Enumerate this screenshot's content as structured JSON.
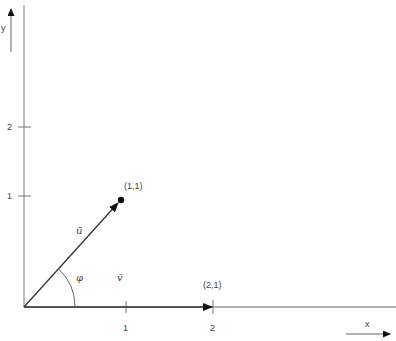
{
  "diagram": {
    "axes": {
      "x_label": "x",
      "y_label": "y",
      "x_ticks": [
        {
          "value": 1,
          "label": "1"
        },
        {
          "value": 2,
          "label": "2"
        }
      ],
      "y_ticks": [
        {
          "value": 1,
          "label": "1"
        },
        {
          "value": 2,
          "label": "2"
        }
      ]
    },
    "vectors": [
      {
        "name": "u",
        "label": "ū",
        "from": [
          0,
          0
        ],
        "to": [
          1,
          1
        ],
        "point_label": "(1,1)"
      },
      {
        "name": "v",
        "label": "̅v",
        "from": [
          0,
          0
        ],
        "to": [
          2,
          0
        ],
        "point_label": "(2,1)"
      }
    ],
    "angle": {
      "label": "φ"
    },
    "labels": {
      "u_vec": "ū",
      "v_vec": "v̄",
      "phi": "φ",
      "pt_u": "(1,1)",
      "pt_v": "(2,1)",
      "x_tick_1": "1",
      "x_tick_2": "2",
      "y_tick_1": "1",
      "y_tick_2": "2",
      "x_axis": "x",
      "y_axis": "y"
    },
    "colors": {
      "axis": "#999999",
      "vector": "#333333",
      "text": "#444444"
    }
  }
}
